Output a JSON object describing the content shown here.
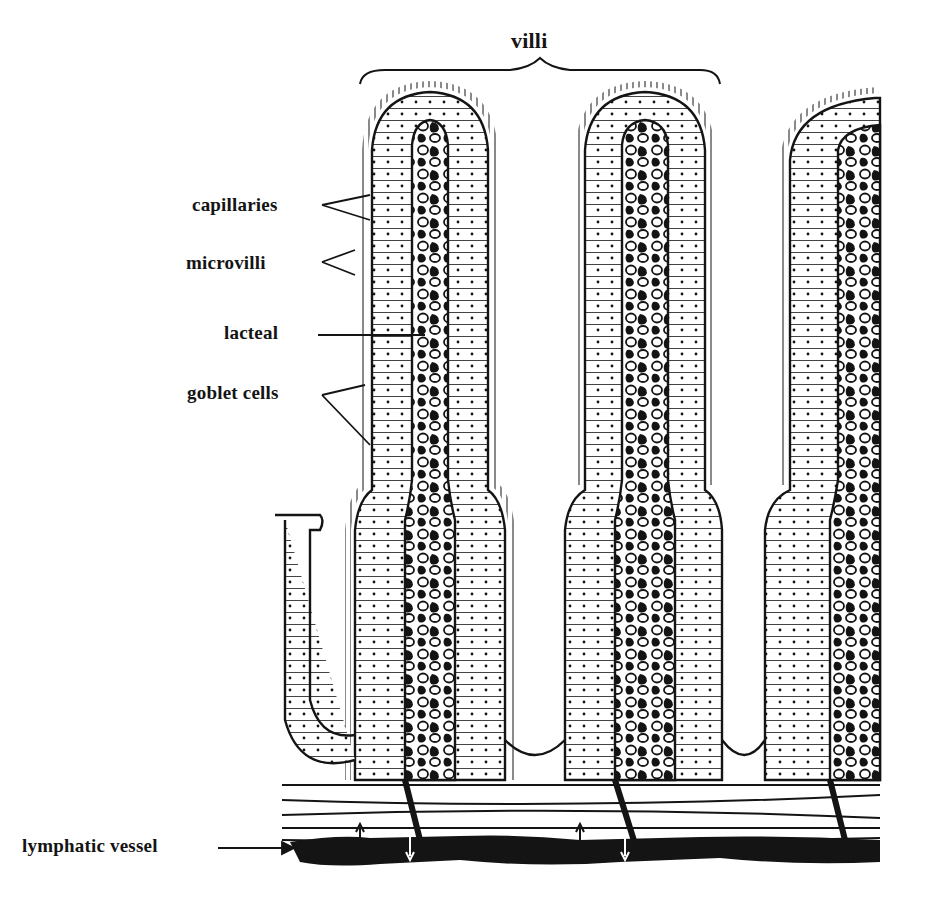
{
  "diagram": {
    "colors": {
      "ink": "#141414",
      "paper": "#ffffff"
    },
    "labels": {
      "villi": "villi",
      "capillaries": "capillaries",
      "microvilli": "microvilli",
      "lacteal": "lacteal",
      "goblet_cells": "goblet cells",
      "lymphatic_vessel": "lymphatic vessel"
    }
  }
}
